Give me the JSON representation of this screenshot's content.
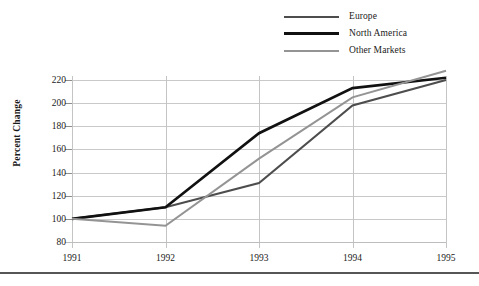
{
  "chart_data": {
    "type": "line",
    "title": "",
    "xlabel": "",
    "ylabel": "Percent Change",
    "categories": [
      "1991",
      "1992",
      "1993",
      "1994",
      "1995"
    ],
    "x": [
      1991,
      1992,
      1993,
      1994,
      1995
    ],
    "xlim": [
      1991,
      1995
    ],
    "ylim": [
      80,
      228
    ],
    "yticks": [
      80,
      100,
      120,
      140,
      160,
      180,
      200,
      220
    ],
    "xticks": [
      "1991",
      "1992",
      "1993",
      "1994",
      "1995"
    ],
    "grid": "horizontal-and-vertical",
    "legend_position": "top-right",
    "series": [
      {
        "name": "Europe",
        "color": "#4d4d4d",
        "line_width": 2,
        "values": [
          100,
          110,
          131,
          198,
          220
        ]
      },
      {
        "name": "North America",
        "color": "#111111",
        "line_width": 2.6,
        "values": [
          100,
          110,
          174,
          213,
          222
        ]
      },
      {
        "name": "Other Markets",
        "color": "#949494",
        "line_width": 2,
        "values": [
          100,
          94,
          152,
          205,
          228
        ]
      }
    ]
  },
  "legend": {
    "items": [
      {
        "label": "Europe",
        "color": "#4d4d4d",
        "line_width": 2
      },
      {
        "label": "North America",
        "color": "#111111",
        "line_width": 3
      },
      {
        "label": "Other Markets",
        "color": "#949494",
        "line_width": 2
      }
    ]
  },
  "axes": {
    "y_axis_title": "Percent Change",
    "y_tick_labels": [
      "220",
      "200",
      "180",
      "160",
      "140",
      "120",
      "100",
      "80"
    ],
    "x_tick_labels": [
      "1991",
      "1992",
      "1993",
      "1994",
      "1995"
    ]
  },
  "colors": {
    "europe": "#4d4d4d",
    "north_america": "#111111",
    "other_markets": "#949494",
    "gridline": "#c9c9c9",
    "rule": "#565656"
  }
}
